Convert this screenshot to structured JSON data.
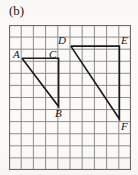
{
  "figure": {
    "part_label": "(b)",
    "background_color": "#fbfaf7",
    "grid": {
      "columns": 10,
      "rows": 12,
      "cell_width": 12.2,
      "cell_height": 12.08,
      "line_color": "#8d8d8d",
      "border_color": "#6b6b6b",
      "grid_on": true,
      "origin_x": 9,
      "origin_y": 25,
      "width": 122,
      "height": 145
    },
    "shape_color": "#1a1a1a",
    "shape_line_width": 1.6,
    "vertices": [
      {
        "name": "A",
        "label": "A",
        "x": 22.0,
        "y": 58.2,
        "label_x": 13,
        "label_y": 49
      },
      {
        "name": "B",
        "label": "B",
        "x": 58.6,
        "y": 106.6,
        "label_x": 55,
        "label_y": 108
      },
      {
        "name": "C",
        "label": "C",
        "x": 58.6,
        "y": 58.2,
        "label_x": 49,
        "label_y": 49
      },
      {
        "name": "D",
        "label": "D",
        "x": 70.8,
        "y": 46.1,
        "label_x": 58,
        "label_y": 35
      },
      {
        "name": "E",
        "label": "E",
        "x": 119.4,
        "y": 46.1,
        "label_x": 121,
        "label_y": 35
      },
      {
        "name": "F",
        "label": "F",
        "x": 119.4,
        "y": 119.0,
        "label_x": 121,
        "label_y": 121
      }
    ],
    "shapes": [
      {
        "name": "triangle-abc",
        "closed": false,
        "points": [
          {
            "vertex": "A",
            "x": 22.0,
            "y": 58.2
          },
          {
            "vertex": "C",
            "x": 58.6,
            "y": 58.2
          },
          {
            "vertex": "B",
            "x": 58.6,
            "y": 106.6
          },
          {
            "vertex": "A",
            "x": 22.0,
            "y": 58.2
          }
        ]
      },
      {
        "name": "triangle-def",
        "closed": false,
        "points": [
          {
            "vertex": "D",
            "x": 70.8,
            "y": 46.1
          },
          {
            "vertex": "E",
            "x": 119.4,
            "y": 46.1
          },
          {
            "vertex": "F",
            "x": 119.4,
            "y": 119.0
          },
          {
            "vertex": "D",
            "x": 70.8,
            "y": 46.1
          }
        ]
      }
    ]
  }
}
